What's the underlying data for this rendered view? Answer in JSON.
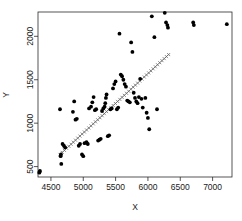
{
  "chart_data": {
    "type": "scatter",
    "title": "",
    "xlabel": "X",
    "ylabel": "Y",
    "xlim": [
      4300,
      7300
    ],
    "ylim": [
      380,
      2280
    ],
    "xticks": [
      4500,
      5000,
      5500,
      6000,
      6500,
      7000
    ],
    "yticks": [
      500,
      1000,
      1500,
      2000
    ],
    "xtick_labels": [
      "4500",
      "5000",
      "5500",
      "6000",
      "6500",
      "7000"
    ],
    "ytick_labels": [
      "500",
      "1000",
      "1500",
      "2000"
    ],
    "grid": false,
    "legend": "none",
    "point_marker": "filled-circle",
    "point_color": "#000000",
    "fit_line_marker": "x",
    "fit_line_color": "#555555",
    "series": [
      {
        "name": "observations",
        "x": [
          4320,
          4325,
          4330,
          4640,
          4650,
          4655,
          4660,
          4680,
          4700,
          4720,
          4840,
          4860,
          4880,
          4900,
          4930,
          4950,
          4980,
          5000,
          5020,
          5050,
          5070,
          5090,
          5120,
          5140,
          5160,
          5180,
          5200,
          5230,
          5250,
          5270,
          5290,
          5310,
          5330,
          5340,
          5350,
          5360,
          5380,
          5400,
          5420,
          5440,
          5460,
          5480,
          5500,
          5520,
          5540,
          5560,
          5580,
          5600,
          5620,
          5640,
          5660,
          5680,
          5700,
          5720,
          5740,
          5760,
          5780,
          5800,
          5820,
          5840,
          5860,
          5880,
          5900,
          5920,
          5960,
          5980,
          6000,
          6020,
          6060,
          6100,
          6140,
          6260,
          6280,
          6300,
          6310,
          6700,
          6710,
          7220
        ],
        "y": [
          430,
          440,
          450,
          1160,
          620,
          640,
          530,
          760,
          740,
          720,
          1130,
          1250,
          1040,
          1050,
          740,
          760,
          640,
          620,
          770,
          780,
          760,
          1170,
          1190,
          1240,
          1300,
          1150,
          1160,
          800,
          810,
          820,
          1140,
          1170,
          1190,
          1230,
          1290,
          1330,
          850,
          860,
          1160,
          1170,
          1400,
          1450,
          1480,
          1160,
          1180,
          2030,
          1560,
          1540,
          1500,
          1450,
          1420,
          1260,
          1250,
          1240,
          1930,
          1820,
          1350,
          1290,
          1250,
          1230,
          1300,
          1510,
          1280,
          1180,
          1290,
          1120,
          1060,
          930,
          2230,
          1990,
          1160,
          2270,
          2160,
          2130,
          2100,
          2160,
          2130,
          2140
        ]
      }
    ],
    "fit_line": {
      "name": "fitted-line",
      "x_start": 4640,
      "y_start": 640,
      "x_end": 6320,
      "y_end": 1790
    }
  }
}
